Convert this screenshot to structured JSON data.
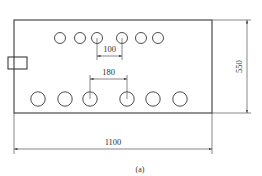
{
  "figure": {
    "caption": "(a)",
    "plate": {
      "x": 14,
      "y": 20,
      "width": 198,
      "height": 93
    },
    "tab": {
      "x": 8,
      "y": 57,
      "width": 19,
      "height": 12
    },
    "top_holes": {
      "cy": 38,
      "r": 5.5,
      "cx": [
        60,
        80,
        97,
        122,
        141,
        158
      ]
    },
    "bottom_holes": {
      "cy": 99,
      "r": 7.2,
      "cx": [
        38,
        65,
        90,
        127,
        153,
        180
      ]
    },
    "dimensions": {
      "width_label": "1100",
      "height_label": "550",
      "top_spacing_label": "100",
      "bottom_spacing_label": "180"
    }
  }
}
